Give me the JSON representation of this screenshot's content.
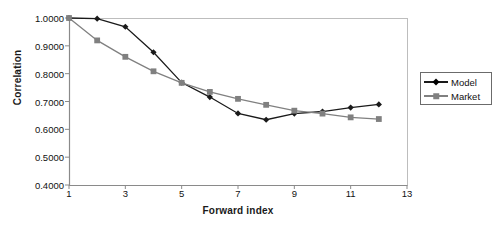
{
  "chart_data": {
    "type": "line",
    "title": "",
    "xlabel": "Forward index",
    "ylabel": "Correlation",
    "x": [
      1,
      2,
      3,
      4,
      5,
      6,
      7,
      8,
      9,
      10,
      11,
      12
    ],
    "xlim": [
      1,
      13
    ],
    "ylim": [
      0.4,
      1.0
    ],
    "xticks": [
      "1",
      "3",
      "5",
      "7",
      "9",
      "11",
      "13"
    ],
    "xtick_values": [
      1,
      3,
      5,
      7,
      9,
      11,
      13
    ],
    "yticks": [
      "0.4000",
      "0.5000",
      "0.6000",
      "0.7000",
      "0.8000",
      "0.9000",
      "1.0000"
    ],
    "ytick_values": [
      0.4,
      0.5,
      0.6,
      0.7,
      0.8,
      0.9,
      1.0
    ],
    "grid": false,
    "legend_position": "right-outside",
    "series": [
      {
        "name": "Model",
        "color": "#1a1a1a",
        "marker": "diamond",
        "values": [
          1.0,
          0.9975,
          0.9685,
          0.877,
          0.768,
          0.716,
          0.657,
          0.6345,
          0.6565,
          0.664,
          0.678,
          0.6895
        ]
      },
      {
        "name": "Market",
        "color": "#808080",
        "marker": "square",
        "values": [
          1.0,
          0.9195,
          0.8605,
          0.8085,
          0.767,
          0.7345,
          0.7095,
          0.688,
          0.667,
          0.6565,
          0.643,
          0.637
        ]
      }
    ]
  },
  "legend": {
    "entries": [
      {
        "label": "Model"
      },
      {
        "label": "Market"
      }
    ]
  },
  "colors": {
    "model": "#1a1a1a",
    "market": "#808080",
    "axis": "#999999",
    "text": "#111111"
  }
}
